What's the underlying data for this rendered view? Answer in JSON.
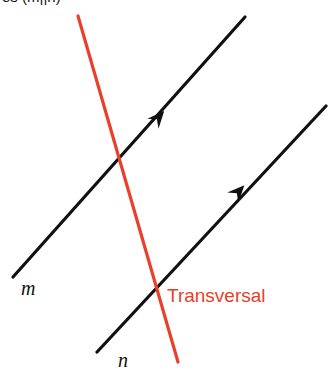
{
  "figure": {
    "caption_clipped": "es (m||n)",
    "background_color": "#ffffff",
    "width": 328,
    "height": 377,
    "labels": {
      "line_m": "m",
      "line_n": "n",
      "transversal": "Transversal"
    },
    "colors": {
      "line": "#111111",
      "transversal": "#E8402A",
      "transversal_text": "#E8402A"
    }
  },
  "chart_data": {
    "type": "diagram",
    "title": "es (m||n)",
    "xlim": [
      0,
      328
    ],
    "ylim": [
      0,
      377
    ],
    "grid": false,
    "legend": "none",
    "elements": [
      {
        "name": "line-m",
        "kind": "line",
        "label": "m",
        "color": "#111111",
        "width": 3,
        "x1": 13,
        "y1": 277,
        "x2": 245,
        "y2": 17,
        "arrow": {
          "x": 158,
          "y": 118,
          "angle_deg": -48.3,
          "style": "solid-triangle"
        }
      },
      {
        "name": "line-n",
        "kind": "line",
        "label": "n",
        "color": "#111111",
        "width": 3,
        "x1": 97,
        "y1": 352,
        "x2": 326,
        "y2": 106,
        "arrow": {
          "x": 238,
          "y": 192,
          "angle_deg": -47.0,
          "style": "solid-triangle"
        }
      },
      {
        "name": "transversal-line",
        "kind": "line",
        "label": "Transversal",
        "color": "#E8402A",
        "width": 3,
        "x1": 78,
        "y1": 16,
        "x2": 178,
        "y2": 362,
        "arrow": null
      }
    ],
    "intersections": [
      {
        "name": "m-transversal",
        "x": 118,
        "y": 155
      },
      {
        "name": "n-transversal",
        "x": 157,
        "y": 297
      }
    ],
    "annotations": [
      {
        "name": "label-m",
        "text": "m",
        "x": 21,
        "y": 290,
        "color": "#111111",
        "style": "italic-serif"
      },
      {
        "name": "label-n",
        "text": "n",
        "x": 118,
        "y": 362,
        "color": "#111111",
        "style": "italic-serif"
      },
      {
        "name": "label-transversal",
        "text": "Transversal",
        "x": 167,
        "y": 297,
        "color": "#E8402A",
        "style": "sans-serif"
      }
    ]
  }
}
